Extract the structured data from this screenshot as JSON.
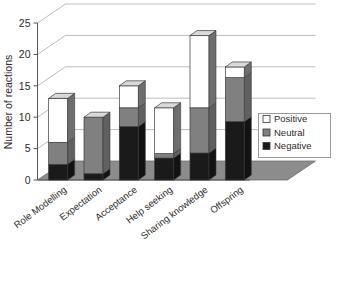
{
  "chart_data": {
    "type": "bar",
    "subtype": "stacked-3d-column",
    "title": "",
    "xlabel": "",
    "ylabel": "Number of reactions",
    "ylim": [
      0,
      25
    ],
    "yticks": [
      0,
      5,
      10,
      15,
      20,
      25
    ],
    "grid": true,
    "legend_position": "right",
    "categories": [
      "Role Modelling",
      "Expectation",
      "Acceptance",
      "Help seeking",
      "Sharing knowledge",
      "Offspring"
    ],
    "series": [
      {
        "name": "Negative",
        "color": "#1a1a1a",
        "values": [
          2.5,
          1,
          8.5,
          3.5,
          4.3,
          9.3
        ]
      },
      {
        "name": "Neutral",
        "color": "#808080",
        "values": [
          3.5,
          9,
          3,
          0.7,
          7.2,
          7
        ]
      },
      {
        "name": "Positive",
        "color": "#ffffff",
        "values": [
          7,
          0,
          3.5,
          7.3,
          11.5,
          1.7
        ]
      }
    ],
    "totals": [
      13,
      10,
      15,
      11.5,
      23,
      18
    ]
  },
  "legend": {
    "items": [
      {
        "label": "Positive",
        "swatch": "#ffffff",
        "icon": "legend-swatch-positive"
      },
      {
        "label": "Neutral",
        "swatch": "#808080",
        "icon": "legend-swatch-neutral"
      },
      {
        "label": "Negative",
        "swatch": "#1a1a1a",
        "icon": "legend-swatch-negative"
      }
    ]
  },
  "axes": {
    "y_title": "Number of reactions",
    "y_ticks": [
      "0",
      "5",
      "10",
      "15",
      "20",
      "25"
    ],
    "x_labels": [
      "Role Modelling",
      "Expectation",
      "Acceptance",
      "Help seeking",
      "Sharing knowledge",
      "Offspring"
    ]
  },
  "colors": {
    "positive": "#ffffff",
    "neutral": "#808080",
    "negative": "#1a1a1a",
    "floor": "#8c8c8c",
    "grid": "#bdbdbd",
    "axis": "#555555",
    "side_shade": "#6e6e6e",
    "top_shade": "#d9d9d9"
  }
}
